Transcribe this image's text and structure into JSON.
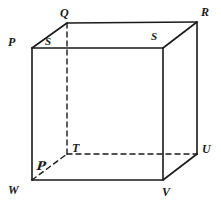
{
  "figure": {
    "kind": "cube-diagram",
    "width": 221,
    "height": 207,
    "background_color": "#ffffff",
    "stroke_color": "#1a1a1a",
    "dash_color": "#1a1a1a",
    "solid_stroke_width": 1.6,
    "dashed_stroke_width": 1.4,
    "dash_pattern": "5,4"
  },
  "vertices": [
    {
      "id": "front-top-left",
      "label": "P",
      "label_x": 8,
      "label_y": 36,
      "point_x": 32,
      "point_y": 48,
      "hidden": false
    },
    {
      "id": "back-top-left",
      "label": "Q",
      "label_x": 60,
      "label_y": 7,
      "point_x": 67,
      "point_y": 23,
      "hidden": false
    },
    {
      "id": "back-top-right",
      "label": "R",
      "label_x": 201,
      "label_y": 6,
      "point_x": 197,
      "point_y": 22,
      "hidden": false
    },
    {
      "id": "front-top-right",
      "label": "S",
      "label_x": 151,
      "label_y": 31,
      "point_x": 163,
      "point_y": 48,
      "hidden": false
    },
    {
      "id": "top-left-inner",
      "label": "S",
      "label_x": 45,
      "label_y": 36,
      "point_x": 56,
      "point_y": 48,
      "hidden": false
    },
    {
      "id": "back-bottom-left",
      "label": "T",
      "label_x": 72,
      "label_y": 142,
      "point_x": 67,
      "point_y": 154,
      "hidden": true
    },
    {
      "id": "back-bottom-right",
      "label": "U",
      "label_x": 202,
      "label_y": 143,
      "point_x": 197,
      "point_y": 154,
      "hidden": true
    },
    {
      "id": "front-bottom-right",
      "label": "V",
      "label_x": 162,
      "label_y": 186,
      "point_x": 163,
      "point_y": 180,
      "hidden": false
    },
    {
      "id": "front-bottom-left",
      "label": "W",
      "label_x": 8,
      "label_y": 184,
      "point_x": 32,
      "point_y": 180,
      "hidden": false
    }
  ],
  "annotations": [
    {
      "id": "script-p",
      "label": "ᵊB",
      "glyph": "P",
      "label_x": 37,
      "label_y": 160
    }
  ],
  "edges": {
    "solid": [
      {
        "name": "front-top",
        "x1": 32,
        "y1": 48,
        "x2": 163,
        "y2": 48
      },
      {
        "name": "front-left",
        "x1": 32,
        "y1": 48,
        "x2": 32,
        "y2": 180
      },
      {
        "name": "front-right",
        "x1": 163,
        "y1": 48,
        "x2": 163,
        "y2": 180
      },
      {
        "name": "front-bottom",
        "x1": 32,
        "y1": 180,
        "x2": 163,
        "y2": 180
      },
      {
        "name": "back-top",
        "x1": 67,
        "y1": 23,
        "x2": 197,
        "y2": 22
      },
      {
        "name": "back-right-vertical",
        "x1": 197,
        "y1": 22,
        "x2": 197,
        "y2": 154
      },
      {
        "name": "diagonal-top-left",
        "x1": 32,
        "y1": 48,
        "x2": 67,
        "y2": 23
      },
      {
        "name": "diagonal-top-right",
        "x1": 163,
        "y1": 48,
        "x2": 197,
        "y2": 22
      },
      {
        "name": "diagonal-bottom-right",
        "x1": 163,
        "y1": 180,
        "x2": 197,
        "y2": 154
      }
    ],
    "dashed": [
      {
        "name": "hidden-vertical-QT",
        "x1": 67,
        "y1": 23,
        "x2": 67,
        "y2": 154
      },
      {
        "name": "hidden-bottom-TU",
        "x1": 67,
        "y1": 154,
        "x2": 197,
        "y2": 154
      },
      {
        "name": "hidden-diagonal-WT",
        "x1": 32,
        "y1": 180,
        "x2": 67,
        "y2": 154
      }
    ]
  }
}
